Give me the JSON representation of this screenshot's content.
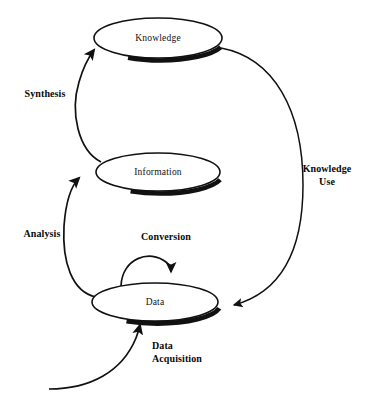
{
  "diagram": {
    "background_color": "#ffffff",
    "stroke_color": "#111111",
    "text_color": "#0a0a0a",
    "nodes": [
      {
        "id": "knowledge",
        "label": "Knowledge",
        "cx": 158,
        "cy": 38,
        "rx": 64,
        "ry": 20
      },
      {
        "id": "information",
        "label": "Information",
        "cx": 158,
        "cy": 172,
        "rx": 62,
        "ry": 19
      },
      {
        "id": "data",
        "label": "Data",
        "cx": 155,
        "cy": 302,
        "rx": 63,
        "ry": 19
      }
    ],
    "edges": [
      {
        "id": "data-acquisition",
        "label_lines": [
          "Data",
          "Acquisition"
        ],
        "label_x": 152,
        "label_y": 349,
        "align": "start"
      },
      {
        "id": "conversion",
        "label_lines": [
          "Conversion"
        ],
        "label_x": 166,
        "label_y": 240,
        "align": "center"
      },
      {
        "id": "analysis",
        "label_lines": [
          "Analysis"
        ],
        "label_x": 42,
        "label_y": 237,
        "align": "center"
      },
      {
        "id": "synthesis",
        "label_lines": [
          "Synthesis"
        ],
        "label_x": 45,
        "label_y": 97,
        "align": "center"
      },
      {
        "id": "knowledge-use",
        "label_lines": [
          "Knowledge",
          "Use"
        ],
        "label_x": 327,
        "label_y": 173,
        "align": "center"
      }
    ],
    "caption": ""
  }
}
